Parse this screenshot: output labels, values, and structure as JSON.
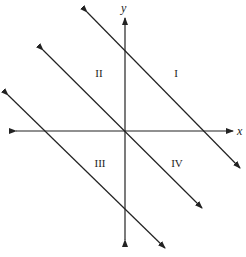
{
  "diagram": {
    "axes": {
      "x_label": "x",
      "y_label": "y",
      "origin": [
        125,
        131
      ],
      "x_axis": {
        "from": [
          16,
          131
        ],
        "to": [
          233,
          131
        ]
      },
      "y_axis": {
        "from": [
          125,
          240
        ],
        "to": [
          125,
          18
        ]
      }
    },
    "lines": [
      {
        "name": "upper-line",
        "from": [
          87,
          12
        ],
        "to": [
          240,
          168
        ]
      },
      {
        "name": "middle-line",
        "from": [
          43,
          50
        ],
        "to": [
          202,
          208
        ]
      },
      {
        "name": "lower-line",
        "from": [
          8,
          95
        ],
        "to": [
          165,
          248
        ]
      }
    ],
    "regions": [
      {
        "label": "I",
        "pos": [
          176,
          77
        ]
      },
      {
        "label": "II",
        "pos": [
          99,
          77
        ]
      },
      {
        "label": "III",
        "pos": [
          100,
          167
        ]
      },
      {
        "label": "IV",
        "pos": [
          177,
          167
        ]
      }
    ],
    "colors": {
      "stroke": "#222222",
      "background": "#ffffff"
    }
  }
}
